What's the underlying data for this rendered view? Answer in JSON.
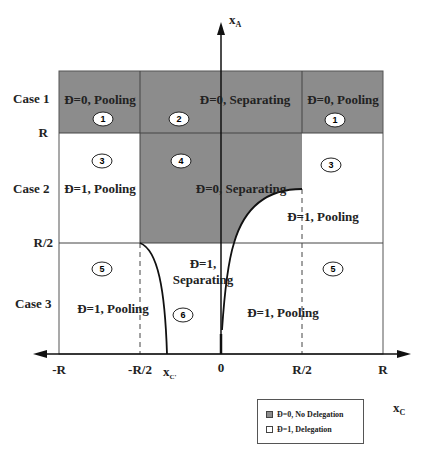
{
  "axes": {
    "y_label": "x",
    "y_label_sub": "A",
    "x_label": "x",
    "x_label_sub": "C",
    "x_ticks": [
      "-R",
      "-R/2",
      "x",
      "0",
      "R/2",
      "R"
    ],
    "x_tick_c_sub": "C'",
    "y_ticks": [
      "R",
      "R/2"
    ]
  },
  "cases": [
    "Case 1",
    "Case 2",
    "Case 3"
  ],
  "regions": {
    "r1_left": "Đ=0, Pooling",
    "r2": "Đ=0, Separating",
    "r1_right": "Đ=0, Pooling",
    "r3_left": "Đ=1, Pooling",
    "r4": "Đ=0, Separating",
    "r3_right": "Đ=1, Pooling",
    "r5_left": "Đ=1, Pooling",
    "r6_line1": "Đ=1,",
    "r6_line2": "Separating",
    "r5_right": "Đ=1, Pooling"
  },
  "region_numbers": [
    "1",
    "2",
    "1",
    "3",
    "4",
    "3",
    "5",
    "6",
    "5"
  ],
  "legend": {
    "items": [
      {
        "label": "Đ=0, No Delegation",
        "color": "#8c8c8c"
      },
      {
        "label": "Đ=1,  Delegation",
        "color": "#ffffff"
      }
    ]
  },
  "colors": {
    "shaded": "#8c8c8c",
    "unshaded": "#ffffff",
    "lines": "#222222"
  }
}
